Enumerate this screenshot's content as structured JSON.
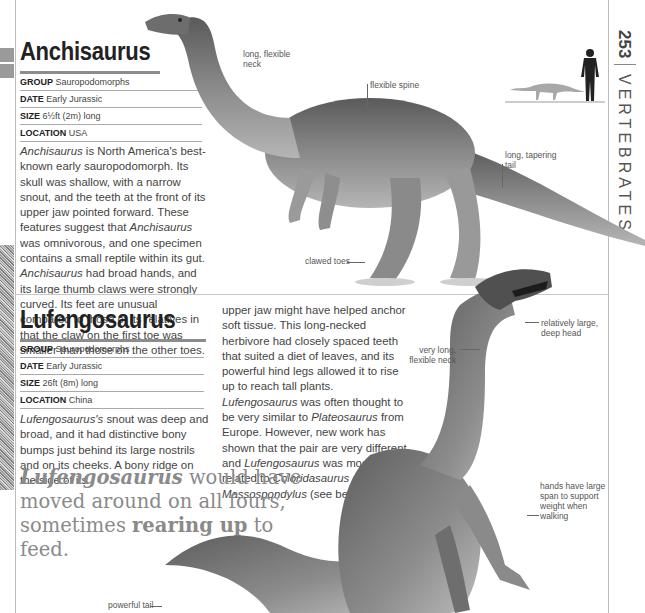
{
  "page": {
    "number": "253",
    "section": "VERTEBRATES"
  },
  "anchisaurus": {
    "title": "Anchisaurus",
    "facts": [
      {
        "key": "GROUP",
        "value": "Sauropodomorphs"
      },
      {
        "key": "DATE",
        "value": "Early Jurassic"
      },
      {
        "key": "SIZE",
        "value": "6½ft (2m) long"
      },
      {
        "key": "LOCATION",
        "value": "USA"
      }
    ],
    "body": [
      {
        "t": "Anchisaurus",
        "i": true
      },
      {
        "t": " is North America's best-known early sauropodomorph. Its skull was shallow, with a narrow snout, and the teeth at the front of its upper jaw pointed forward. These features suggest that ",
        "i": false
      },
      {
        "t": "Anchisaurus",
        "i": true
      },
      {
        "t": " was omnivorous, and one specimen contains a small reptile within its gut. ",
        "i": false
      },
      {
        "t": "Anchisaurus",
        "i": true
      },
      {
        "t": " had broad hands, and its large thumb claws were strongly curved. Its feet are unusual compared to those of its relatives in that the claw on the first toe was smaller than those on the other toes.",
        "i": false
      }
    ],
    "labels": {
      "neck": "long, flexible neck",
      "spine": "flexible spine",
      "tail": "long, tapering tail",
      "toes": "clawed toes"
    }
  },
  "lufengosaurus": {
    "title": "Lufengosaurus",
    "facts": [
      {
        "key": "GROUP",
        "value": "Sauropodomorphs"
      },
      {
        "key": "DATE",
        "value": "Early Jurassic"
      },
      {
        "key": "SIZE",
        "value": "26ft (8m) long"
      },
      {
        "key": "LOCATION",
        "value": "China"
      }
    ],
    "body1": [
      {
        "t": "Lufengosaurus's",
        "i": true
      },
      {
        "t": " snout was deep and broad, and it had distinctive bony bumps just behind its large nostrils and on its cheeks. A bony ridge on the side of its",
        "i": false
      }
    ],
    "body2": [
      {
        "t": "upper jaw might have helped anchor soft tissue. This long-necked herbivore had closely spaced teeth that suited a diet of leaves, and its powerful hind legs allowed it to rise up to reach tall plants. ",
        "i": false
      },
      {
        "t": "Lufengosaurus",
        "i": true
      },
      {
        "t": " was often thought to be very similar to ",
        "i": false
      },
      {
        "t": "Plateosaurus",
        "i": true
      },
      {
        "t": " from Europe. However, new work has shown that the pair are very different, and ",
        "i": false
      },
      {
        "t": "Lufengosaurus",
        "i": true
      },
      {
        "t": " was most closely related to ",
        "i": false
      },
      {
        "t": "Coloridasaurus",
        "i": true
      },
      {
        "t": " and ",
        "i": false
      },
      {
        "t": "Massospondylus",
        "i": true
      },
      {
        "t": " (see below).",
        "i": false
      }
    ],
    "quote": [
      {
        "t": "Lufengosaurus",
        "b": true,
        "i": true
      },
      {
        "t": " would have moved around on all fours, sometimes ",
        "b": false,
        "i": false
      },
      {
        "t": "rearing up",
        "b": true,
        "i": false
      },
      {
        "t": " to feed.",
        "b": false,
        "i": false
      }
    ],
    "labels": {
      "head": "relatively large, deep head",
      "neck": "very long, flexible neck",
      "hands": "hands have large span to support weight when walking",
      "tail": "powerful tail"
    }
  },
  "icons": {
    "scale_human": "human-silhouette-icon",
    "scale_dino": "dinosaur-silhouette-icon"
  }
}
